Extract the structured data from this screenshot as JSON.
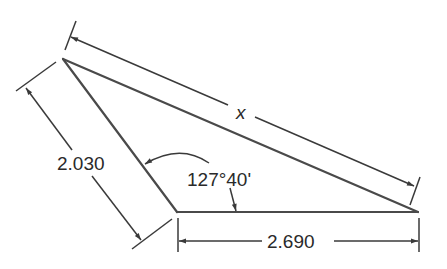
{
  "diagram": {
    "type": "triangle-dimension-drawing",
    "labels": {
      "hypotenuse": "x",
      "left_side": "2.030",
      "bottom_side": "2.690",
      "angle": "127°40'"
    },
    "colors": {
      "line": "#3a3a3a",
      "text": "#2a2a2a",
      "background": "#ffffff"
    }
  }
}
